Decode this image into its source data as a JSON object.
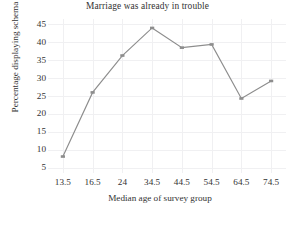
{
  "chart_data": {
    "type": "line",
    "title": "Marriage was already in trouble",
    "xlabel": "Median age of survey group",
    "ylabel": "Percentage displaying schema",
    "categories": [
      "13.5",
      "16.5",
      "24",
      "34.5",
      "44.5",
      "54.5",
      "64.5",
      "74.5"
    ],
    "values": [
      8.1,
      26.0,
      36.3,
      44.0,
      38.5,
      39.4,
      24.3,
      29.2
    ],
    "yticks": [
      "5",
      "10",
      "15",
      "20",
      "25",
      "30",
      "35",
      "40",
      "45"
    ],
    "ylim": [
      3.5,
      46.5
    ],
    "grid": true,
    "legend": "none",
    "series_color": "#8d8d8d",
    "marker": "square",
    "background": "#ffffff",
    "gridline_color": "#f0f0f2"
  }
}
